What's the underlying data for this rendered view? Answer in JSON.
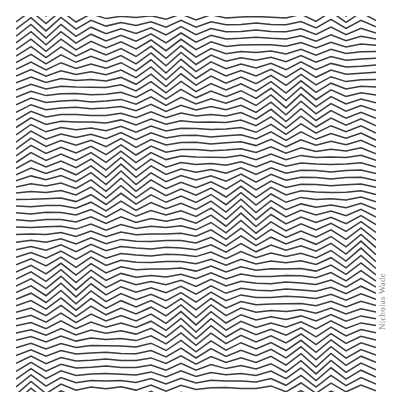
{
  "artwork": {
    "title": "Zigzag op-art pattern",
    "line_color": "#3a3a3a",
    "background_color": "#ffffff",
    "period_px": 30,
    "line_spacing_px": 7
  },
  "credit": {
    "text": "Nicholas Wade",
    "color": "#8a8a8a"
  }
}
